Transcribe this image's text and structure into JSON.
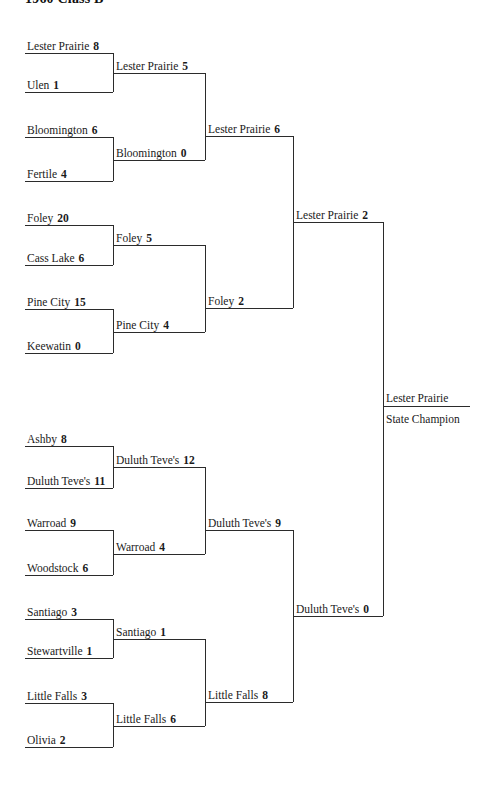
{
  "page": {
    "title": "1960 Class B",
    "line_color": "#2b2b2b",
    "text_color": "#1a1a1a",
    "background": "#ffffff"
  },
  "bracket": {
    "round1": [
      {
        "top": {
          "name": "Lester Prairie",
          "score": "8"
        },
        "bottom": {
          "name": "Ulen",
          "score": "1"
        }
      },
      {
        "top": {
          "name": "Bloomington",
          "score": "6"
        },
        "bottom": {
          "name": "Fertile",
          "score": "4"
        }
      },
      {
        "top": {
          "name": "Foley",
          "score": "20"
        },
        "bottom": {
          "name": "Cass Lake",
          "score": "6"
        }
      },
      {
        "top": {
          "name": "Pine City",
          "score": "15"
        },
        "bottom": {
          "name": "Keewatin",
          "score": "0"
        }
      },
      {
        "top": {
          "name": "Ashby",
          "score": "8"
        },
        "bottom": {
          "name": "Duluth Teve's",
          "score": "11"
        }
      },
      {
        "top": {
          "name": "Warroad",
          "score": "9"
        },
        "bottom": {
          "name": "Woodstock",
          "score": "6"
        }
      },
      {
        "top": {
          "name": "Santiago",
          "score": "3"
        },
        "bottom": {
          "name": "Stewartville",
          "score": "1"
        }
      },
      {
        "top": {
          "name": "Little Falls",
          "score": "3"
        },
        "bottom": {
          "name": "Olivia",
          "score": "2"
        }
      }
    ],
    "round2": [
      {
        "name": "Lester Prairie",
        "score": "5"
      },
      {
        "name": "Bloomington",
        "score": "0"
      },
      {
        "name": "Foley",
        "score": "5"
      },
      {
        "name": "Pine City",
        "score": "4"
      },
      {
        "name": "Duluth Teve's",
        "score": "12"
      },
      {
        "name": "Warroad",
        "score": "4"
      },
      {
        "name": "Santiago",
        "score": "1"
      },
      {
        "name": "Little Falls",
        "score": "6"
      }
    ],
    "round3": [
      {
        "name": "Lester Prairie",
        "score": "6"
      },
      {
        "name": "Foley",
        "score": "2"
      },
      {
        "name": "Duluth Teve's",
        "score": "9"
      },
      {
        "name": "Little Falls",
        "score": "8"
      }
    ],
    "round4": [
      {
        "name": "Lester Prairie",
        "score": "2"
      },
      {
        "name": "Duluth Teve's",
        "score": "0"
      }
    ],
    "champion": {
      "name": "Lester Prairie",
      "label": "State Champion"
    }
  }
}
